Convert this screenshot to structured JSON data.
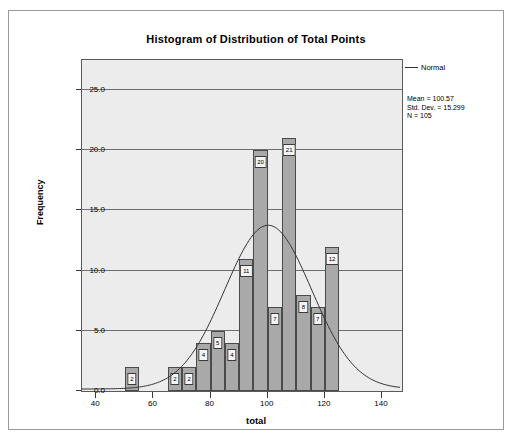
{
  "chart_data": {
    "type": "bar",
    "title": "Histogram of Distribution of Total Points",
    "xlabel": "total",
    "ylabel": "Frequency",
    "xlim": [
      35,
      147
    ],
    "ylim": [
      0,
      27.5
    ],
    "xticks": [
      "40",
      "60",
      "80",
      "100",
      "120",
      "140"
    ],
    "xtick_values": [
      40,
      60,
      80,
      100,
      120,
      140
    ],
    "yticks": [
      "0.0",
      "5.0",
      "10.0",
      "15.0",
      "20.0",
      "25.0"
    ],
    "ytick_values": [
      0,
      5,
      10,
      15,
      20,
      25
    ],
    "grid": true,
    "bin_width": 5,
    "bar_color": "#a9a9a9",
    "plot_background": "#ececec",
    "categories": [
      52.5,
      67.5,
      72.5,
      77.5,
      82.5,
      87.5,
      92.5,
      97.5,
      102.5,
      107.5,
      112.5,
      117.5,
      122.5
    ],
    "values": [
      2,
      2,
      2,
      4,
      5,
      4,
      11,
      20,
      7,
      21,
      8,
      7,
      12
    ],
    "bar_labels": [
      "2",
      "2",
      "2",
      "4",
      "5",
      "4",
      "11",
      "20",
      "7",
      "21",
      "8",
      "7",
      "12"
    ],
    "legend": {
      "position": "right",
      "entries": [
        "Normal"
      ]
    },
    "annotations": {
      "mean_line": "Mean = 100.57",
      "stddev_line": "Std. Dev. = 15.299",
      "n_line": "N = 105"
    },
    "distribution": {
      "mean": 100.57,
      "std_dev": 15.299,
      "n": 105
    }
  },
  "legend": {
    "normal_label": "Normal"
  },
  "stats": {
    "mean": "Mean = 100.57",
    "std_dev": "Std. Dev. = 15.299",
    "n": "N = 105"
  }
}
